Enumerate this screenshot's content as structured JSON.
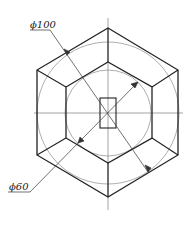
{
  "drawing": {
    "type": "hexagon-nut-top-view",
    "labels": {
      "outer_diameter": "ϕ100",
      "inner_diameter": "ϕ60"
    },
    "colors": {
      "stroke": "#222222",
      "thin": "#555555",
      "background": "#ffffff"
    }
  }
}
